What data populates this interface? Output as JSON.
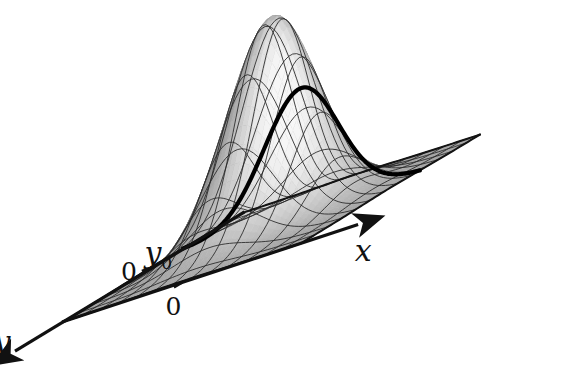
{
  "figure": {
    "kind": "3d-surface-plot",
    "title": "",
    "background_color": "#ffffff",
    "ink_color": "#111111"
  },
  "labels": {
    "x_axis": "x",
    "y_axis": "y",
    "x_origin": "0",
    "y_origin": "0",
    "y_slice": "y",
    "y_slice_subscript": "0"
  },
  "chart_data": {
    "type": "surface",
    "title": "",
    "xlabel": "x",
    "ylabel": "y",
    "zlabel": "",
    "xlim": [
      -3.2,
      3.2
    ],
    "ylim": [
      -3.2,
      3.2
    ],
    "zlim": [
      0,
      1
    ],
    "grid": true,
    "legend": false,
    "function": "z = exp(-(x^2 + y^2)/2)",
    "mesh": {
      "nx": 13,
      "ny": 13
    },
    "peak": {
      "x": 0,
      "y": 0,
      "z": 1
    },
    "highlight_slice": {
      "name": "y = y0",
      "axis": "y",
      "value": -1.05,
      "style": "bold-black-curve",
      "x": [
        -3.2,
        -2.67,
        -2.13,
        -1.6,
        -1.07,
        -0.53,
        0,
        0.53,
        1.07,
        1.6,
        2.13,
        2.67,
        3.2
      ],
      "z": [
        0.033,
        0.095,
        0.208,
        0.341,
        0.447,
        0.512,
        0.575,
        0.512,
        0.447,
        0.341,
        0.208,
        0.095,
        0.033
      ]
    },
    "ticks": {
      "x": [
        {
          "value": 0,
          "label": "0"
        }
      ],
      "y": [
        {
          "value": 0,
          "label": "0"
        },
        {
          "value": -1.05,
          "label": "y0"
        }
      ]
    },
    "shading": {
      "light_direction": "front-right",
      "dark_gray": "#3a3a3a",
      "mid_gray": "#9a9a9a",
      "light_gray": "#e8e8e8"
    }
  }
}
